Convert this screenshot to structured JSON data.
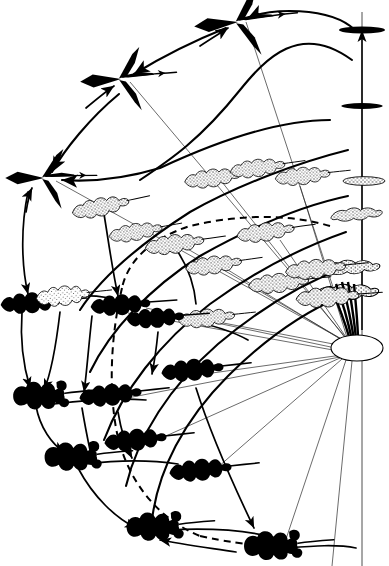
{
  "figure": {
    "background_color": "#ffffff",
    "ink_color": "#000000",
    "width": 389,
    "height": 566
  },
  "axis": {
    "name": "vertical-axis",
    "x": 362,
    "top_y": 12,
    "bottom_y": 560,
    "arrow_direction": "up",
    "tick_nodes": [
      {
        "id": "ax-1",
        "label": "entire-black-blade",
        "x": 362,
        "y": 30,
        "fill": "black",
        "width": 46,
        "height": 7
      },
      {
        "id": "ax-2",
        "label": "entire-black-blade",
        "x": 362,
        "y": 106,
        "fill": "black",
        "width": 40,
        "height": 6
      },
      {
        "id": "ax-3",
        "label": "entire-stippled-blade",
        "x": 364,
        "y": 181,
        "fill": "stipple",
        "width": 42,
        "height": 9
      },
      {
        "id": "ax-4",
        "label": "lobed-stippled-blade",
        "x": 358,
        "y": 214,
        "fill": "stipple",
        "width": 48,
        "height": 12
      },
      {
        "id": "ax-5",
        "label": "lobed-stippled-blade",
        "x": 355,
        "y": 267,
        "fill": "stipple",
        "width": 54,
        "height": 15
      },
      {
        "id": "ax-6",
        "label": "lobed-stippled-blade",
        "x": 352,
        "y": 292,
        "fill": "stipple",
        "width": 58,
        "height": 17
      }
    ]
  },
  "origin_node": {
    "name": "origin-rosette",
    "x": 357,
    "y": 348,
    "rx": 26,
    "ry": 13,
    "fill": "#ffffff",
    "description": "white ellipse hub from which thin rays radiate"
  },
  "nodes": [
    {
      "id": "n1",
      "name": "leaf-node-black-arrow",
      "x": 238,
      "y": 22,
      "style": "black-arrowhead",
      "scale": 1.0,
      "rot": -6
    },
    {
      "id": "n2",
      "name": "leaf-node-black-arrow",
      "x": 121,
      "y": 79,
      "style": "black-arrowhead",
      "scale": 0.93,
      "rot": -4
    },
    {
      "id": "n3",
      "name": "leaf-node-black-arrow",
      "x": 44,
      "y": 178,
      "style": "black-arrowhead",
      "scale": 0.88,
      "rot": 0
    },
    {
      "id": "n4",
      "name": "leaf-node-stipple-lobed",
      "x": 101,
      "y": 207,
      "style": "stipple-lobed",
      "scale": 0.86,
      "rot": -10
    },
    {
      "id": "n5",
      "name": "leaf-node-stipple-lobed",
      "x": 136,
      "y": 232,
      "style": "stipple-lobed",
      "scale": 0.8,
      "rot": -8
    },
    {
      "id": "n6",
      "name": "leaf-node-stipple-lobed",
      "x": 175,
      "y": 244,
      "style": "stipple-lobed",
      "scale": 0.88,
      "rot": -8
    },
    {
      "id": "n7",
      "name": "leaf-node-stipple-lobed",
      "x": 213,
      "y": 178,
      "style": "stipple-lobed",
      "scale": 0.84,
      "rot": -8
    },
    {
      "id": "n8",
      "name": "leaf-node-stipple-lobed",
      "x": 214,
      "y": 265,
      "style": "stipple-lobed",
      "scale": 0.84,
      "rot": -8
    },
    {
      "id": "n9",
      "name": "leaf-node-stipple-lobed",
      "x": 207,
      "y": 318,
      "style": "stipple-lobed",
      "scale": 0.84,
      "rot": -6
    },
    {
      "id": "n10",
      "name": "leaf-node-stipple-lobed",
      "x": 258,
      "y": 168,
      "style": "stipple-lobed",
      "scale": 0.82,
      "rot": -8
    },
    {
      "id": "n11",
      "name": "leaf-node-stipple-lobed",
      "x": 266,
      "y": 232,
      "style": "stipple-lobed",
      "scale": 0.86,
      "rot": -8
    },
    {
      "id": "n12",
      "name": "leaf-node-stipple-lobed",
      "x": 279,
      "y": 283,
      "style": "stipple-lobed",
      "scale": 0.9,
      "rot": -6
    },
    {
      "id": "n13",
      "name": "leaf-node-stipple-lobed",
      "x": 303,
      "y": 176,
      "style": "stipple-lobed",
      "scale": 0.82,
      "rot": -6
    },
    {
      "id": "n14",
      "name": "leaf-node-stipple-lobed",
      "x": 318,
      "y": 269,
      "style": "stipple-lobed",
      "scale": 0.9,
      "rot": -6
    },
    {
      "id": "n15",
      "name": "leaf-node-stipple-lobed",
      "x": 333,
      "y": 297,
      "style": "stipple-lobed",
      "scale": 0.92,
      "rot": -4
    },
    {
      "id": "n16",
      "name": "leaf-node-black-lobed",
      "x": 30,
      "y": 303,
      "style": "black-lobed",
      "scale": 0.92,
      "rot": -4
    },
    {
      "id": "n17",
      "name": "leaf-node-black-lobed",
      "x": 120,
      "y": 305,
      "style": "black-lobed",
      "scale": 0.92,
      "rot": -4
    },
    {
      "id": "n18",
      "name": "leaf-node-black-lobed",
      "x": 62,
      "y": 296,
      "style": "grey-lobed",
      "scale": 0.86,
      "rot": -4
    },
    {
      "id": "n19",
      "name": "leaf-node-black-lobed",
      "x": 155,
      "y": 318,
      "style": "black-lobed",
      "scale": 0.88,
      "rot": -4
    },
    {
      "id": "n20",
      "name": "leaf-node-black-lobed",
      "x": 110,
      "y": 395,
      "style": "black-lobed",
      "scale": 0.96,
      "rot": -6
    },
    {
      "id": "n21",
      "name": "leaf-node-black-round",
      "x": 40,
      "y": 395,
      "style": "black-round",
      "scale": 0.96,
      "rot": -4
    },
    {
      "id": "n22",
      "name": "leaf-node-black-lobed",
      "x": 192,
      "y": 370,
      "style": "black-lobed",
      "scale": 0.96,
      "rot": -6
    },
    {
      "id": "n23",
      "name": "leaf-node-black-lobed",
      "x": 135,
      "y": 440,
      "style": "black-lobed",
      "scale": 0.96,
      "rot": -6
    },
    {
      "id": "n24",
      "name": "leaf-node-black-round",
      "x": 72,
      "y": 456,
      "style": "black-round",
      "scale": 0.98,
      "rot": -4
    },
    {
      "id": "n25",
      "name": "leaf-node-black-lobed",
      "x": 200,
      "y": 470,
      "style": "black-lobed",
      "scale": 0.96,
      "rot": -6
    },
    {
      "id": "n26",
      "name": "leaf-node-black-round",
      "x": 154,
      "y": 526,
      "style": "black-round",
      "scale": 0.98,
      "rot": -4
    },
    {
      "id": "n27",
      "name": "leaf-node-black-round",
      "x": 272,
      "y": 545,
      "style": "black-round",
      "scale": 1.0,
      "rot": -4
    }
  ],
  "edges": {
    "description": "curved transformation arrows between leaf-shape nodes, plus thin radiating rays from the origin hub",
    "arc_count": 14,
    "ray_count": 15,
    "dashed_path_count": 2,
    "arrowheads": true
  },
  "legend": {
    "styles": [
      {
        "key": "black-arrowhead",
        "meaning": "sagittate black leaf"
      },
      {
        "key": "stipple-lobed",
        "meaning": "stippled pinnate-lobed leaf"
      },
      {
        "key": "black-lobed",
        "meaning": "solid black pinnate-lobed leaf"
      },
      {
        "key": "black-round",
        "meaning": "solid black rounded-lobed leaf"
      }
    ]
  }
}
